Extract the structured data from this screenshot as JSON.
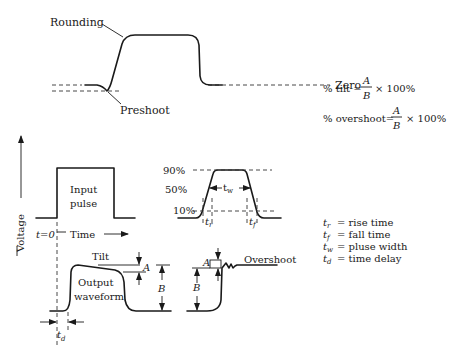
{
  "labels": {
    "rounding": "Rounding",
    "preshoot": "Preshoot",
    "zero": "Zero",
    "voltage": "Voltage",
    "input_pulse_line1": "Input",
    "input_pulse_line2": "pulse",
    "t0": "t=0",
    "time": "Time",
    "tilt": "Tilt",
    "output_line1": "Output",
    "output_line2": "waveform",
    "overshoot": "Overshoot",
    "A": "A",
    "B": "B",
    "td": "t",
    "td_sub": "d",
    "tr": "t",
    "tr_sub": "r",
    "tf": "t",
    "tf_sub": "f",
    "tw": "t",
    "tw_sub": "w",
    "pct90": "90%",
    "pct50": "50%",
    "pct10": "10%"
  },
  "formulas": {
    "tilt_prefix": "% tilt =",
    "overshoot_prefix": "% overshoot=",
    "numerator": "A",
    "denominator": "B",
    "suffix": "× 100%"
  },
  "legend": [
    {
      "sym": "t",
      "sub": "r",
      "desc": "= rise time"
    },
    {
      "sym": "t",
      "sub": "f",
      "desc": "= fall time"
    },
    {
      "sym": "t",
      "sub": "w",
      "desc": "= pluse width"
    },
    {
      "sym": "t",
      "sub": "d",
      "desc": "= time delay"
    }
  ]
}
